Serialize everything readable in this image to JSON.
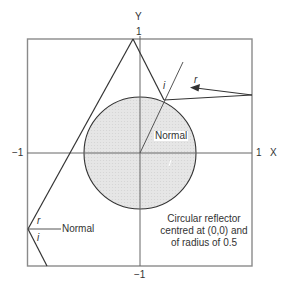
{
  "axes": {
    "x_label": "X",
    "y_label": "Y",
    "x_min_label": "−1",
    "x_max_label": "1",
    "y_min_label": "−1",
    "y_max_label": "1"
  },
  "labels": {
    "circle_normal": "Normal",
    "circle_incidence": "i",
    "circle_reflection": "r",
    "wall_normal": "Normal",
    "wall_reflection": "r",
    "wall_incidence": "i"
  },
  "caption": {
    "line1": "Circular reflector",
    "line2": "centred at (0,0) and",
    "line3": "of radius of 0.5"
  },
  "geometry": {
    "frame": {
      "x_range": [
        -1,
        1
      ],
      "y_range": [
        -1,
        1
      ]
    },
    "circle": {
      "center": [
        0,
        0
      ],
      "radius": 0.5,
      "fill": "#e4e4e4"
    },
    "line_color": "#333333",
    "frame_color": "#888888"
  }
}
